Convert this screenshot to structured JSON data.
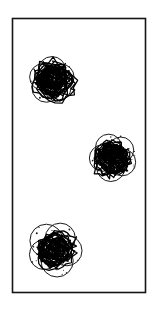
{
  "figure": {
    "title": "",
    "background_color": "#ffffff",
    "ink_color": "#111111",
    "frame": {
      "name": "figure-frame",
      "x": 12.5,
      "y": 18.5,
      "width": 133,
      "height": 274,
      "stroke_color": "#151515",
      "stroke_width": 1.6,
      "fill": "#ffffff"
    },
    "style": {
      "outline_stroke_color": "#1a1a1a",
      "outline_stroke_width": 1.0,
      "scribble_stroke_color": "#000000",
      "scribble_stroke_width": 1.25,
      "speckle_color": "#1a1a1a",
      "speckle_radius": 0.65
    },
    "clusters": [
      {
        "name": "cluster-top-left",
        "label": "1",
        "center_x": 52,
        "center_y": 80,
        "radius": 23,
        "petal_count": 5,
        "petal_radius": 13.5,
        "petal_offset": 9.5,
        "petal_rotation_deg": -18,
        "scribble_loops": 34,
        "scribble_radius": 16,
        "scribble_density": 0.94,
        "speckle_count": 26,
        "seed": 101
      },
      {
        "name": "cluster-middle-right",
        "label": "2",
        "center_x": 113,
        "center_y": 157,
        "radius": 24,
        "petal_count": 5,
        "petal_radius": 14,
        "petal_offset": 10.5,
        "petal_rotation_deg": 30,
        "scribble_loops": 32,
        "scribble_radius": 15.5,
        "scribble_density": 0.88,
        "speckle_count": 30,
        "seed": 202
      },
      {
        "name": "cluster-bottom-left",
        "label": "3",
        "center_x": 55,
        "center_y": 249,
        "radius": 27,
        "petal_count": 5,
        "petal_radius": 15.5,
        "petal_offset": 12,
        "petal_rotation_deg": 8,
        "scribble_loops": 30,
        "scribble_radius": 15,
        "scribble_density": 0.8,
        "speckle_count": 34,
        "seed": 303
      }
    ]
  }
}
